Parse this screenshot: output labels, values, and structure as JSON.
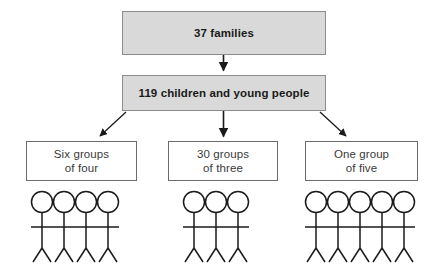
{
  "diagram": {
    "type": "flowchart",
    "title_node": {
      "id": "families",
      "text": "37 families",
      "count": 37,
      "fill": "#d9d9d9",
      "border": "#8c8c8c"
    },
    "second_node": {
      "id": "children",
      "text": "119 children and young people",
      "count": 119,
      "fill": "#d9d9d9",
      "border": "#8c8c8c"
    },
    "groups": [
      {
        "id": "group-six-of-four",
        "line1": "Six groups",
        "line2": "of four",
        "groups_count": 6,
        "per_group": 4,
        "figures": 4,
        "fill": "#ffffff",
        "border": "#6b6b6b"
      },
      {
        "id": "group-thirty-of-three",
        "line1": "30 groups",
        "line2": "of three",
        "groups_count": 30,
        "per_group": 3,
        "figures": 3,
        "fill": "#ffffff",
        "border": "#6b6b6b"
      },
      {
        "id": "group-one-of-five",
        "line1": "One group",
        "line2": "of five",
        "groups_count": 1,
        "per_group": 5,
        "figures": 5,
        "fill": "#ffffff",
        "border": "#6b6b6b"
      }
    ],
    "connectors": [
      {
        "id": "arrow-families-to-children",
        "shape": "vertical"
      },
      {
        "id": "arrow-children-to-group-1",
        "shape": "diagonal-left"
      },
      {
        "id": "arrow-children-to-group-2",
        "shape": "vertical"
      },
      {
        "id": "arrow-children-to-group-3",
        "shape": "diagonal-right"
      }
    ],
    "colors": {
      "stroke": "#1a1a1a",
      "box_fill": "#d9d9d9",
      "box_border": "#8c8c8c",
      "plain_border": "#6b6b6b",
      "text": "#1a1a1a",
      "text_plain": "#3a3a3a",
      "background": "#ffffff"
    }
  }
}
